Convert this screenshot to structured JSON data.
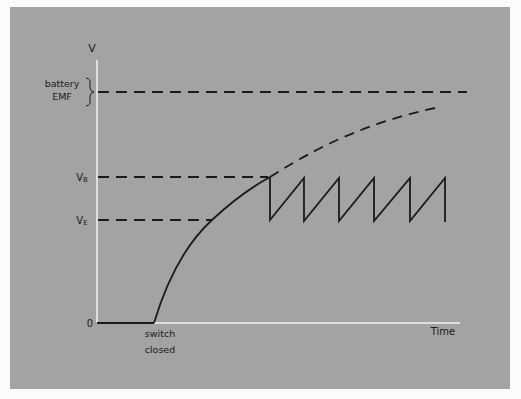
{
  "diagram": {
    "y_axis_label": "V",
    "x_axis_label": "Time",
    "origin_label": "0",
    "levels": {
      "battery_emf": {
        "line1": "battery",
        "line2": "EMF"
      },
      "vb": {
        "main": "V",
        "sub": "B"
      },
      "ve": {
        "main": "V",
        "sub": "E"
      }
    },
    "event_label": {
      "line1": "switch",
      "line2": "closed"
    },
    "colors": {
      "background": "#a3a3a3",
      "axis": "#f2f2f2",
      "curve": "#1a1a1a",
      "page": "#fbfbfb"
    }
  }
}
